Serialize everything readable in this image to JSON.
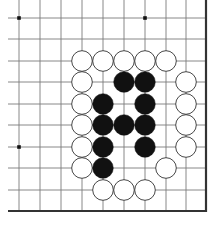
{
  "board": {
    "title": "Go board fragment",
    "columns": 10,
    "rows": 10,
    "col_x": [
      19,
      40,
      61,
      82,
      103,
      124,
      145,
      166,
      186
    ],
    "row_y": [
      18,
      39,
      61,
      82,
      104,
      125,
      147,
      168,
      190
    ],
    "edge_right_x": 206,
    "edge_bottom_y": 211,
    "line_left_x": 8,
    "line_top_y": 0,
    "stone_radius": 10.3,
    "colors": {
      "background": "#ffffff",
      "grid_line": "#7a7a7a",
      "edge_line": "#333333",
      "black_stone": "#111111",
      "white_stone": "#ffffff",
      "white_stone_outline": "#333333",
      "star_point": "#111111"
    },
    "star_points": [
      [
        0,
        0
      ],
      [
        6,
        0
      ],
      [
        0,
        6
      ]
    ],
    "stones": [
      {
        "color": "white",
        "col": 3,
        "row": 2
      },
      {
        "color": "white",
        "col": 4,
        "row": 2
      },
      {
        "color": "white",
        "col": 5,
        "row": 2
      },
      {
        "color": "white",
        "col": 6,
        "row": 2
      },
      {
        "color": "white",
        "col": 7,
        "row": 2
      },
      {
        "color": "white",
        "col": 3,
        "row": 3
      },
      {
        "color": "black",
        "col": 5,
        "row": 3
      },
      {
        "color": "black",
        "col": 6,
        "row": 3
      },
      {
        "color": "white",
        "col": 8,
        "row": 3
      },
      {
        "color": "white",
        "col": 3,
        "row": 4
      },
      {
        "color": "black",
        "col": 4,
        "row": 4
      },
      {
        "color": "black",
        "col": 6,
        "row": 4
      },
      {
        "color": "white",
        "col": 8,
        "row": 4
      },
      {
        "color": "white",
        "col": 3,
        "row": 5
      },
      {
        "color": "black",
        "col": 4,
        "row": 5
      },
      {
        "color": "black",
        "col": 5,
        "row": 5
      },
      {
        "color": "black",
        "col": 6,
        "row": 5
      },
      {
        "color": "white",
        "col": 8,
        "row": 5
      },
      {
        "color": "white",
        "col": 3,
        "row": 6
      },
      {
        "color": "black",
        "col": 4,
        "row": 6
      },
      {
        "color": "black",
        "col": 6,
        "row": 6
      },
      {
        "color": "white",
        "col": 8,
        "row": 6
      },
      {
        "color": "white",
        "col": 3,
        "row": 7
      },
      {
        "color": "black",
        "col": 4,
        "row": 7
      },
      {
        "color": "white",
        "col": 7,
        "row": 7
      },
      {
        "color": "white",
        "col": 4,
        "row": 8
      },
      {
        "color": "white",
        "col": 5,
        "row": 8
      },
      {
        "color": "white",
        "col": 6,
        "row": 8
      }
    ]
  }
}
